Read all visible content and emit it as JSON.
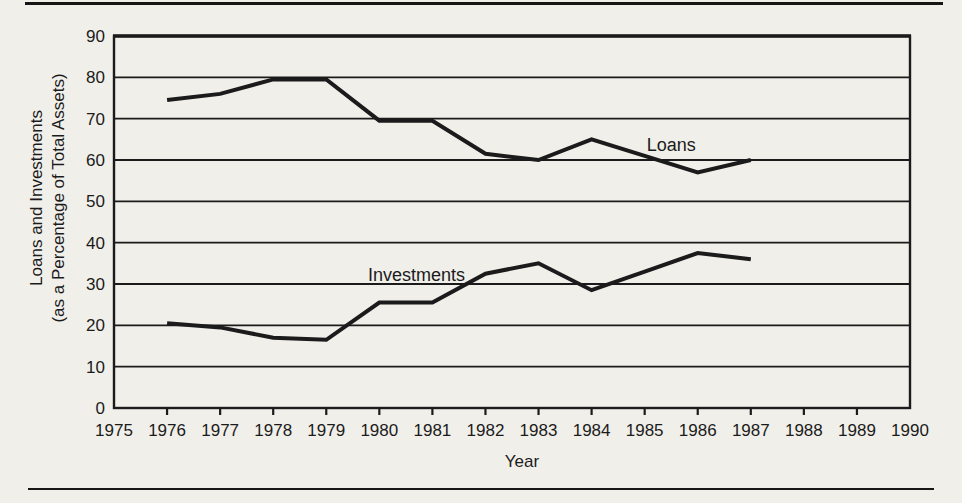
{
  "colors": {
    "paper": "#f1efea",
    "ink": "#1b1b1b"
  },
  "chart_data": {
    "type": "line",
    "title": "",
    "xlabel": "Year",
    "ylabel_line1": "Loans and Investments",
    "ylabel_line2": "(as a Percentage of Total Assets)",
    "xlim": [
      1975,
      1990
    ],
    "ylim": [
      0,
      90
    ],
    "x_ticks": [
      1975,
      1976,
      1977,
      1978,
      1979,
      1980,
      1981,
      1982,
      1983,
      1984,
      1985,
      1986,
      1987,
      1988,
      1989,
      1990
    ],
    "y_ticks": [
      0,
      10,
      20,
      30,
      40,
      50,
      60,
      70,
      80,
      90
    ],
    "grid": "horizontal gridlines every 10 units",
    "legend": "inline annotations next to lines",
    "x": [
      1976,
      1977,
      1978,
      1979,
      1980,
      1981,
      1982,
      1983,
      1984,
      1985,
      1986,
      1987
    ],
    "series": [
      {
        "name": "Loans",
        "values": [
          74.5,
          76,
          79.5,
          79.5,
          69.5,
          69.5,
          61.5,
          60,
          65,
          61,
          57,
          60
        ]
      },
      {
        "name": "Investments",
        "values": [
          20.5,
          19.5,
          17,
          16.5,
          25.5,
          25.5,
          32.5,
          35,
          28.5,
          33,
          37.5,
          36
        ]
      }
    ],
    "annotations": [
      {
        "text": "Loans",
        "x": 1985.5,
        "y": 62.2
      },
      {
        "text": "Investments",
        "x": 1980.7,
        "y": 30.8
      }
    ]
  }
}
